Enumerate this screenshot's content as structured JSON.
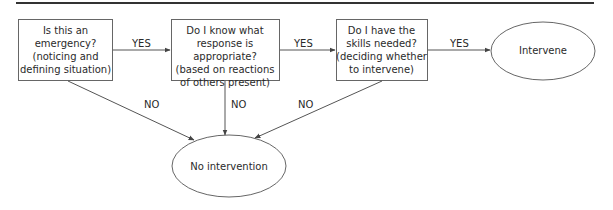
{
  "diagram": {
    "type": "flowchart",
    "nodes": [
      {
        "id": "q1",
        "shape": "rectangle",
        "text": "Is this an\nemergency?\n(noticing and\ndefining situation)"
      },
      {
        "id": "q2",
        "shape": "rectangle",
        "text": "Do I know what\nresponse is appropriate?\n(based on reactions\nof others present)"
      },
      {
        "id": "q3",
        "shape": "rectangle",
        "text": "Do I have the\nskills needed?\n(deciding whether\nto intervene)"
      },
      {
        "id": "intervene",
        "shape": "ellipse",
        "text": "Intervene"
      },
      {
        "id": "no_intervention",
        "shape": "ellipse",
        "text": "No intervention"
      }
    ],
    "edges": [
      {
        "from": "q1",
        "to": "q2",
        "label": "YES"
      },
      {
        "from": "q2",
        "to": "q3",
        "label": "YES"
      },
      {
        "from": "q3",
        "to": "intervene",
        "label": "YES"
      },
      {
        "from": "q1",
        "to": "no_intervention",
        "label": "NO"
      },
      {
        "from": "q2",
        "to": "no_intervention",
        "label": "NO"
      },
      {
        "from": "q3",
        "to": "no_intervention",
        "label": "NO"
      }
    ],
    "colors": {
      "stroke": "#555555",
      "text": "#2a2a2a",
      "rule": "#333333"
    }
  }
}
